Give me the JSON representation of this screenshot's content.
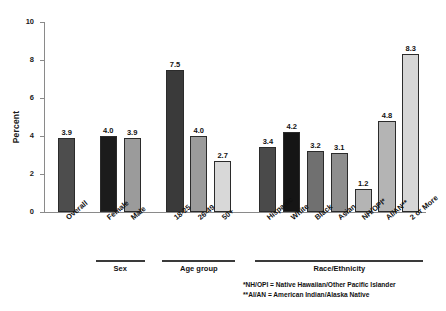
{
  "chart_data": {
    "type": "bar",
    "title": "",
    "xlabel": "",
    "ylabel": "Percent",
    "ylim": [
      0,
      10
    ],
    "yticks": [
      0,
      2,
      4,
      6,
      8,
      10
    ],
    "grid": false,
    "legend": "none",
    "categories": [
      "Overall",
      "Female",
      "Male",
      "18-25",
      "26-49",
      "50+",
      "Hispanic",
      "White",
      "Black",
      "Asian",
      "NH/OPI*",
      "AI/AN**",
      "2 or More"
    ],
    "values": [
      3.9,
      4.0,
      3.9,
      7.5,
      4.0,
      2.7,
      3.4,
      4.2,
      3.2,
      3.1,
      1.2,
      4.8,
      8.3
    ],
    "value_labels": [
      "3.9",
      "4.0",
      "3.9",
      "7.5",
      "4.0",
      "2.7",
      "3.4",
      "4.2",
      "3.2",
      "3.1",
      "1.2",
      "4.8",
      "8.3"
    ],
    "bar_colors": [
      "#4d4d4d",
      "#1c1c1c",
      "#9b9b9b",
      "#3a3a3a",
      "#9b9b9b",
      "#d8d8d8",
      "#4a4a4a",
      "#151515",
      "#707070",
      "#8e8e8e",
      "#b4b4b4",
      "#b4b4b4",
      "#d6d6d6"
    ],
    "groups": [
      {
        "label": "Sex",
        "categories": [
          "Female",
          "Male"
        ]
      },
      {
        "label": "Age group",
        "categories": [
          "18-25",
          "26-49",
          "50+"
        ]
      },
      {
        "label": "Race/Ethnicity",
        "categories": [
          "Hispanic",
          "White",
          "Black",
          "Asian",
          "NH/OPI*",
          "AI/AN**",
          "2 or More"
        ]
      }
    ]
  },
  "footnotes": [
    "*NH/OPI = Native Hawaiian/Other Pacific Islander",
    "**AI/AN = American Indian/Alaska Native"
  ]
}
